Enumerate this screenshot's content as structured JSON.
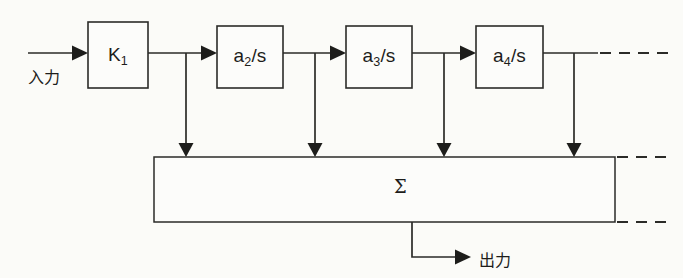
{
  "figure": {
    "kind": "control-system-block-diagram",
    "background_color": "#fbfbf8",
    "line_color": "#2b2b28"
  },
  "signals": {
    "input_label": "入力",
    "output_label": "出力"
  },
  "blocks": [
    {
      "id": "k1",
      "base": "K",
      "sub": "1",
      "tail": "",
      "x": 88,
      "y": 22,
      "w": 60,
      "h": 66
    },
    {
      "id": "a2s",
      "base": "a",
      "sub": "2",
      "tail": "/s",
      "x": 217,
      "y": 26,
      "w": 66,
      "h": 62
    },
    {
      "id": "a3s",
      "base": "a",
      "sub": "3",
      "tail": "/s",
      "x": 346,
      "y": 26,
      "w": 66,
      "h": 62
    },
    {
      "id": "a4s",
      "base": "a",
      "sub": "4",
      "tail": "/s",
      "x": 476,
      "y": 26,
      "w": 67,
      "h": 62
    }
  ],
  "summing_block": {
    "label": "Σ",
    "x": 154,
    "y": 157,
    "w": 461,
    "h": 65,
    "label_x": 400,
    "label_y": 183
  },
  "taps": [
    {
      "id": "tap-1",
      "x": 186
    },
    {
      "id": "tap-2",
      "x": 315
    },
    {
      "id": "tap-3",
      "x": 444
    },
    {
      "id": "tap-4",
      "x": 574
    }
  ],
  "geometry": {
    "main_line_y": 53,
    "input_line_start_x": 28,
    "continuation_dash_start_x": 600,
    "continuation_dash_end_x": 672,
    "sum_dash_start_x": 615,
    "sum_dash_end_x": 672,
    "output_drop_x": 412,
    "output_line_y": 257,
    "output_arrow_x": 470
  },
  "caption": {
    "title": "入力 → K₁ → a₂/s → a₃/s → a₄/s → Σ → 出力",
    "note": "Cascaded integrator chain with feed-forward taps into a summing bar"
  }
}
